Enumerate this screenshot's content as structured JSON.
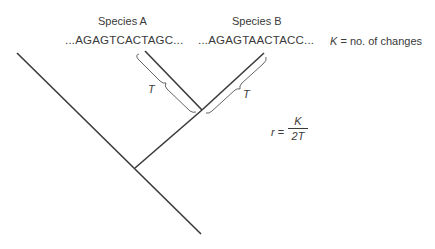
{
  "diagram": {
    "type": "phylogenetic-tree",
    "species": [
      {
        "label": "Species A",
        "sequence": "...AGAGTCACTAGC..."
      },
      {
        "label": "Species B",
        "sequence": "...AGAGTAACTACC..."
      }
    ],
    "k_definition": {
      "symbol": "K",
      "text": " = no. of changes"
    },
    "branch_time_labels": [
      "T",
      "T"
    ],
    "formula": {
      "lhs": "r",
      "eq": " = ",
      "numerator": "K",
      "denominator": "2T"
    },
    "colors": {
      "line": "#3a3a3a",
      "bracket": "#555555",
      "text": "#3a3a3a"
    }
  }
}
